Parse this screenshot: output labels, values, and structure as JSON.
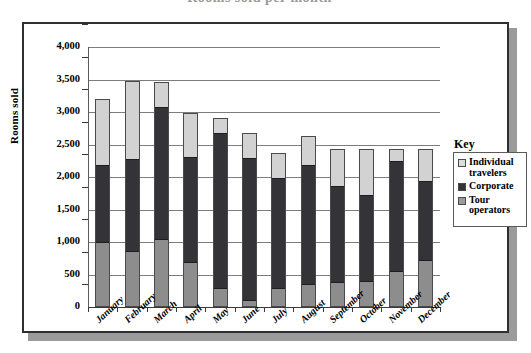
{
  "title_partial": "Rooms sold per month",
  "chart_data": {
    "type": "bar",
    "subtype": "stacked-vertical",
    "title": "Rooms sold per month",
    "xlabel": "",
    "ylabel": "Rooms sold",
    "ylim": [
      0,
      4000
    ],
    "ytick_step": 500,
    "ytick_labels": [
      "4,000",
      "3,500",
      "3,000",
      "2,500",
      "2,000",
      "1,500",
      "1,000",
      "500",
      "0"
    ],
    "ytick_values": [
      4000,
      3500,
      3000,
      2500,
      2000,
      1500,
      1000,
      500,
      0
    ],
    "grid": true,
    "grid_axis": "y",
    "legend_title": "Key",
    "legend_position": "right",
    "categories": [
      "January",
      "February",
      "March",
      "April",
      "May",
      "June",
      "July",
      "August",
      "September",
      "October",
      "November",
      "December"
    ],
    "series": [
      {
        "name": "Tour operators",
        "color": "#8d8d8d",
        "values": [
          980,
          840,
          1030,
          670,
          270,
          90,
          270,
          340,
          370,
          380,
          540,
          710
        ]
      },
      {
        "name": "Corporate",
        "color": "#333338",
        "values": [
          1190,
          1420,
          2030,
          1620,
          2390,
          2190,
          1700,
          1830,
          1470,
          1330,
          1690,
          1220
        ]
      },
      {
        "name": "Individual travelers",
        "color": "#d2d2d2",
        "values": [
          1000,
          1190,
          370,
          660,
          220,
          370,
          370,
          430,
          560,
          690,
          170,
          470
        ]
      }
    ],
    "totals": [
      3170,
      3450,
      3430,
      2950,
      2880,
      2650,
      2340,
      2600,
      2400,
      2400,
      2400,
      2400
    ]
  },
  "legend": {
    "title": "Key",
    "items": [
      {
        "label": "Individual travelers",
        "swatch": "individual-travelers-swatch"
      },
      {
        "label": "Corporate",
        "swatch": "corporate-swatch"
      },
      {
        "label": "Tour operators",
        "swatch": "tour-operators-swatch"
      }
    ]
  }
}
